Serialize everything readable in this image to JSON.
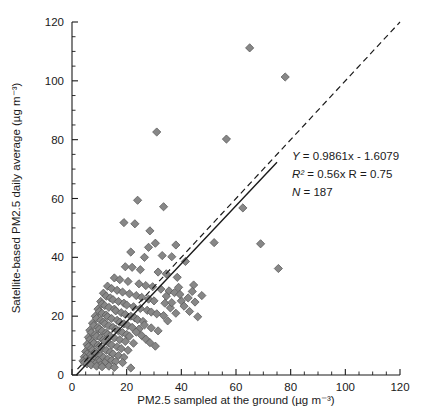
{
  "chart_data": {
    "type": "scatter",
    "title": "",
    "xlabel": "PM2.5 sampled at the ground (µg m⁻³)",
    "ylabel": "Satellite-based PM2.5 daily average (µg m⁻³)",
    "xlim": [
      0,
      120
    ],
    "ylim": [
      0,
      120
    ],
    "xticks": [
      0,
      20,
      40,
      60,
      80,
      100,
      120
    ],
    "yticks": [
      0,
      20,
      40,
      60,
      80,
      100,
      120
    ],
    "xtick_labels": [
      "0",
      "20",
      "40",
      "60",
      "80",
      "100",
      "120"
    ],
    "ytick_labels": [
      "0",
      "20",
      "40",
      "60",
      "80",
      "100",
      "120"
    ],
    "minor_tick_step": 5,
    "grid": false,
    "legend": null,
    "marker": {
      "shape": "diamond",
      "fill_color": "#878787",
      "edge_color": "#5a5a5a",
      "size_px": 7
    },
    "annotations": {
      "equation": "Y = 0.9861x - 1.6079",
      "r_squared": "R² = 0.56x R = 0.75",
      "n": "N = 187",
      "position": {
        "x": 68,
        "y": 66
      }
    },
    "lines": [
      {
        "name": "regression-fit",
        "style": "solid",
        "slope": 0.9861,
        "intercept": -1.6079,
        "x_start": 1.6,
        "x_end": 75
      },
      {
        "name": "one-to-one",
        "style": "dashed",
        "slope": 1,
        "intercept": 0,
        "x_start": 2,
        "x_end": 120
      }
    ],
    "points": [
      [
        65.0,
        111.2
      ],
      [
        78.0,
        101.3
      ],
      [
        31.0,
        82.6
      ],
      [
        56.5,
        80.2
      ],
      [
        62.5,
        56.8
      ],
      [
        75.5,
        36.2
      ],
      [
        69.0,
        44.6
      ],
      [
        52.0,
        45.0
      ],
      [
        24.0,
        59.4
      ],
      [
        33.5,
        57.2
      ],
      [
        19.0,
        51.8
      ],
      [
        23.0,
        51.4
      ],
      [
        28.5,
        49.0
      ],
      [
        30.5,
        44.8
      ],
      [
        38.0,
        44.2
      ],
      [
        33.0,
        40.6
      ],
      [
        36.5,
        40.2
      ],
      [
        26.5,
        40.0
      ],
      [
        41.5,
        38.6
      ],
      [
        44.5,
        30.6
      ],
      [
        19.5,
        36.8
      ],
      [
        22.0,
        36.6
      ],
      [
        31.5,
        35.0
      ],
      [
        34.5,
        34.4
      ],
      [
        38.5,
        33.2
      ],
      [
        40.0,
        25.2
      ],
      [
        45.0,
        24.8
      ],
      [
        42.5,
        26.2
      ],
      [
        15.5,
        33.0
      ],
      [
        17.5,
        32.4
      ],
      [
        20.5,
        31.8
      ],
      [
        24.5,
        31.0
      ],
      [
        27.0,
        30.4
      ],
      [
        29.5,
        30.0
      ],
      [
        32.5,
        29.2
      ],
      [
        35.5,
        28.6
      ],
      [
        37.5,
        28.0
      ],
      [
        39.5,
        27.4
      ],
      [
        13.0,
        30.2
      ],
      [
        14.5,
        29.4
      ],
      [
        16.5,
        28.8
      ],
      [
        18.5,
        28.2
      ],
      [
        21.0,
        27.6
      ],
      [
        23.5,
        27.0
      ],
      [
        25.5,
        26.4
      ],
      [
        28.0,
        25.8
      ],
      [
        30.0,
        25.2
      ],
      [
        34.0,
        24.4
      ],
      [
        11.5,
        27.8
      ],
      [
        12.5,
        26.8
      ],
      [
        14.0,
        26.2
      ],
      [
        15.0,
        25.6
      ],
      [
        17.0,
        25.0
      ],
      [
        19.0,
        24.4
      ],
      [
        20.0,
        23.8
      ],
      [
        22.5,
        23.2
      ],
      [
        25.0,
        22.6
      ],
      [
        27.5,
        22.0
      ],
      [
        29.0,
        21.4
      ],
      [
        31.0,
        20.8
      ],
      [
        10.5,
        25.0
      ],
      [
        11.0,
        24.2
      ],
      [
        12.0,
        23.6
      ],
      [
        13.5,
        23.0
      ],
      [
        15.5,
        22.4
      ],
      [
        16.0,
        21.8
      ],
      [
        18.0,
        21.2
      ],
      [
        19.5,
        20.6
      ],
      [
        21.5,
        20.0
      ],
      [
        23.0,
        19.4
      ],
      [
        24.0,
        18.8
      ],
      [
        26.0,
        18.2
      ],
      [
        9.5,
        22.4
      ],
      [
        10.0,
        21.6
      ],
      [
        11.0,
        21.0
      ],
      [
        12.5,
        20.4
      ],
      [
        13.0,
        19.8
      ],
      [
        14.5,
        19.2
      ],
      [
        16.5,
        18.6
      ],
      [
        17.5,
        18.0
      ],
      [
        19.0,
        17.4
      ],
      [
        20.5,
        16.8
      ],
      [
        22.0,
        16.2
      ],
      [
        24.5,
        15.6
      ],
      [
        8.5,
        20.0
      ],
      [
        9.0,
        19.2
      ],
      [
        10.5,
        18.6
      ],
      [
        11.5,
        18.0
      ],
      [
        12.0,
        17.4
      ],
      [
        13.5,
        16.8
      ],
      [
        15.0,
        16.2
      ],
      [
        16.0,
        15.6
      ],
      [
        17.0,
        15.0
      ],
      [
        18.5,
        14.4
      ],
      [
        20.0,
        13.8
      ],
      [
        21.0,
        13.2
      ],
      [
        7.5,
        17.6
      ],
      [
        8.0,
        16.8
      ],
      [
        9.5,
        16.2
      ],
      [
        10.0,
        15.6
      ],
      [
        11.0,
        15.0
      ],
      [
        12.5,
        14.4
      ],
      [
        13.0,
        13.8
      ],
      [
        14.0,
        13.2
      ],
      [
        15.5,
        12.6
      ],
      [
        17.5,
        12.0
      ],
      [
        19.5,
        11.4
      ],
      [
        22.5,
        10.8
      ],
      [
        6.5,
        15.2
      ],
      [
        7.0,
        14.4
      ],
      [
        8.5,
        13.8
      ],
      [
        9.0,
        13.2
      ],
      [
        10.5,
        12.6
      ],
      [
        11.5,
        12.0
      ],
      [
        12.0,
        11.4
      ],
      [
        13.5,
        10.8
      ],
      [
        14.5,
        10.2
      ],
      [
        16.5,
        9.6
      ],
      [
        18.0,
        9.0
      ],
      [
        20.5,
        8.4
      ],
      [
        6.0,
        12.8
      ],
      [
        6.5,
        12.0
      ],
      [
        7.5,
        11.4
      ],
      [
        8.0,
        10.8
      ],
      [
        9.5,
        10.2
      ],
      [
        10.0,
        9.6
      ],
      [
        11.0,
        9.0
      ],
      [
        12.5,
        8.4
      ],
      [
        14.0,
        7.8
      ],
      [
        15.0,
        7.2
      ],
      [
        17.0,
        6.6
      ],
      [
        19.0,
        6.0
      ],
      [
        5.5,
        10.4
      ],
      [
        6.0,
        9.6
      ],
      [
        7.0,
        9.0
      ],
      [
        7.5,
        8.4
      ],
      [
        8.5,
        7.8
      ],
      [
        9.0,
        7.2
      ],
      [
        10.5,
        6.6
      ],
      [
        11.5,
        6.0
      ],
      [
        13.0,
        5.4
      ],
      [
        14.5,
        5.0
      ],
      [
        16.0,
        4.6
      ],
      [
        18.5,
        4.2
      ],
      [
        5.0,
        8.0
      ],
      [
        5.5,
        7.2
      ],
      [
        6.5,
        6.6
      ],
      [
        7.0,
        6.0
      ],
      [
        8.0,
        5.4
      ],
      [
        9.5,
        5.0
      ],
      [
        10.0,
        4.6
      ],
      [
        12.0,
        4.2
      ],
      [
        4.5,
        6.2
      ],
      [
        5.0,
        5.6
      ],
      [
        6.0,
        5.0
      ],
      [
        6.5,
        4.6
      ],
      [
        7.5,
        4.2
      ],
      [
        8.5,
        3.8
      ],
      [
        10.5,
        3.4
      ],
      [
        13.5,
        3.0
      ],
      [
        4.0,
        4.8
      ],
      [
        4.5,
        4.2
      ],
      [
        5.5,
        3.8
      ],
      [
        7.0,
        3.4
      ],
      [
        9.0,
        3.0
      ],
      [
        11.0,
        2.8
      ],
      [
        15.5,
        2.6
      ],
      [
        21.5,
        2.4
      ],
      [
        23.5,
        14.6
      ],
      [
        25.5,
        13.4
      ],
      [
        27.0,
        12.2
      ],
      [
        28.5,
        11.0
      ],
      [
        30.5,
        9.8
      ],
      [
        26.5,
        17.0
      ],
      [
        29.0,
        16.0
      ],
      [
        31.5,
        15.0
      ],
      [
        33.5,
        20.2
      ],
      [
        35.0,
        18.4
      ],
      [
        36.0,
        22.8
      ],
      [
        38.0,
        21.0
      ],
      [
        41.0,
        23.4
      ],
      [
        43.0,
        21.6
      ],
      [
        46.0,
        19.8
      ],
      [
        44.0,
        28.4
      ],
      [
        47.5,
        27.0
      ],
      [
        36.5,
        24.6
      ],
      [
        39.0,
        29.8
      ],
      [
        34.5,
        26.8
      ],
      [
        25.0,
        35.8
      ],
      [
        21.5,
        41.8
      ],
      [
        28.0,
        43.4
      ]
    ]
  },
  "figure": {
    "background_color": "#ffffff",
    "axis_color": "#1a1a1a"
  }
}
